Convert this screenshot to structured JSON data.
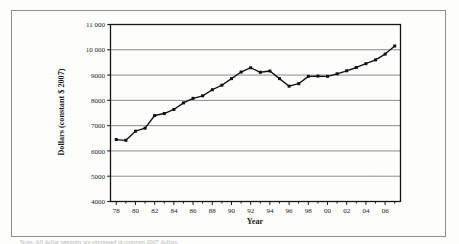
{
  "figure": {
    "border_color": "#8e8e8e",
    "background": "#fdfdfc",
    "caption_fragment": "Note:  All dollar amounts are expressed in constant 2007 dollars."
  },
  "chart_data": {
    "type": "line",
    "title": "",
    "subtitle": "",
    "xlabel": "Year",
    "ylabel": "Dollars (constant $ 2007)",
    "xlim": [
      1977.4,
      2007.6
    ],
    "ylim": [
      4000,
      11000
    ],
    "grid": true,
    "grid_axis": "y",
    "legend": false,
    "legend_position": "none",
    "marker": "square",
    "marker_color": "#111111",
    "line_color": "#111111",
    "ytick_labels": [
      "4000",
      "5000",
      "6000",
      "7000",
      "8000",
      "9000",
      "10 000",
      "11 000"
    ],
    "ytick_values": [
      4000,
      5000,
      6000,
      7000,
      8000,
      9000,
      10000,
      11000
    ],
    "xtick_labels": [
      "78",
      "80",
      "82",
      "84",
      "86",
      "88",
      "90",
      "92",
      "94",
      "96",
      "98",
      "00",
      "02",
      "04",
      "06"
    ],
    "xtick_values": [
      1978,
      1980,
      1982,
      1984,
      1986,
      1988,
      1990,
      1992,
      1994,
      1996,
      1998,
      2000,
      2002,
      2004,
      2006
    ],
    "x": [
      1978,
      1979,
      1980,
      1981,
      1982,
      1983,
      1984,
      1985,
      1986,
      1987,
      1988,
      1989,
      1990,
      1991,
      1992,
      1993,
      1994,
      1995,
      1996,
      1997,
      1998,
      1999,
      2000,
      2001,
      2002,
      2003,
      2004,
      2005,
      2006,
      2007
    ],
    "values": [
      6450,
      6420,
      6780,
      6900,
      7400,
      7480,
      7640,
      7900,
      8080,
      8180,
      8420,
      8600,
      8860,
      9120,
      9290,
      9110,
      9160,
      8860,
      8560,
      8660,
      8950,
      8960,
      8950,
      9050,
      9170,
      9300,
      9450,
      9600,
      9830,
      10150
    ],
    "series": [
      {
        "name": "Dollars (constant $ 2007)",
        "values": [
          6450,
          6420,
          6780,
          6900,
          7400,
          7480,
          7640,
          7900,
          8080,
          8180,
          8420,
          8600,
          8860,
          9120,
          9290,
          9110,
          9160,
          8860,
          8560,
          8660,
          8950,
          8960,
          8950,
          9050,
          9170,
          9300,
          9450,
          9600,
          9830,
          10150
        ]
      }
    ]
  }
}
